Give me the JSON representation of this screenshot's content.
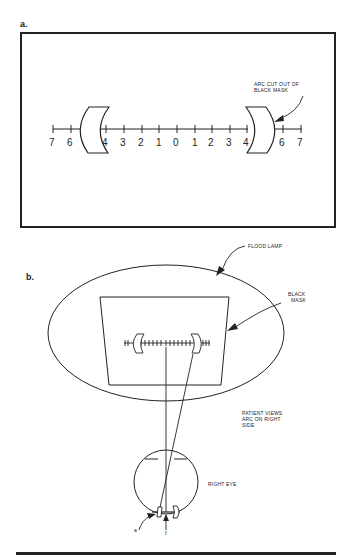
{
  "panel_a": {
    "label": "a.",
    "scale_numbers": [
      "7",
      "6",
      "4",
      "3",
      "2",
      "1",
      "0",
      "1",
      "2",
      "3",
      "4",
      "6",
      "7"
    ],
    "callout": [
      "ARC CUT OUT OF",
      "BLACK MASK"
    ]
  },
  "panel_b": {
    "label": "b.",
    "flood_lamp_label": "FLOOD LAMP",
    "black_mask_label": [
      "BLACK",
      "MASK"
    ],
    "patient_views_label": [
      "PATIENT VIEWS",
      "ARC ON RIGHT",
      "SIDE"
    ],
    "eye_label": "RIGHT EYE",
    "marker_a": "a",
    "marker_f": "f"
  },
  "colors": {
    "ink": "#222222",
    "background": "#ffffff"
  }
}
